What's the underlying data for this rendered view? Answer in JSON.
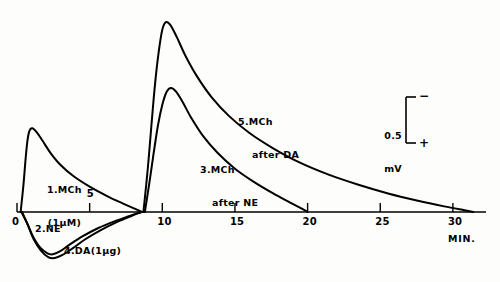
{
  "figure": {
    "title": "",
    "background_color": "#fdfdfb",
    "ink_color": "#000000"
  },
  "axis": {
    "x_name": "MIN.",
    "x_ticks": [
      "0",
      "5",
      "10",
      "15",
      "20",
      "25",
      "30"
    ],
    "x_tick_values": [
      0,
      5,
      10,
      15,
      20,
      25,
      30
    ]
  },
  "scale_bar": {
    "value": "0.5",
    "unit": "mV",
    "top_sign": "−",
    "bottom_sign": "+"
  },
  "curve_labels": {
    "c1_line1": "1.MCh",
    "c1_line2": "(1μM)",
    "c2": "2.NE",
    "c3_line1": "3.MCh",
    "c3_line2": "after NE",
    "c4": "4.DA(1μg)",
    "c5_line1": "5.MCh",
    "c5_line2": "after DA"
  },
  "chart_data": {
    "type": "line",
    "title": "",
    "xlabel": "MIN.",
    "ylabel": "mV",
    "xlim": [
      0,
      32
    ],
    "ylim": [
      -0.55,
      2.2
    ],
    "grid": false,
    "legend": "inline-annotations",
    "xticks": [
      0,
      5,
      10,
      15,
      20,
      25,
      30
    ],
    "scale_bar_mV": 0.5,
    "polarity": {
      "up": "negative",
      "down": "positive"
    },
    "series": [
      {
        "name": "1.MCh (1μM)",
        "label": "1.MCh (1μM)",
        "drug": "MCh",
        "dose": "1 μM",
        "peak_time_min": 0.85,
        "peak_mV": 0.86,
        "onset_time_min": 0.25,
        "return_time_min": 8.6,
        "points": [
          [
            0.25,
            0.0
          ],
          [
            0.45,
            0.3
          ],
          [
            0.6,
            0.58
          ],
          [
            0.72,
            0.76
          ],
          [
            0.85,
            0.86
          ],
          [
            1.05,
            0.89
          ],
          [
            1.35,
            0.85
          ],
          [
            1.75,
            0.76
          ],
          [
            2.3,
            0.63
          ],
          [
            3.0,
            0.5
          ],
          [
            3.9,
            0.38
          ],
          [
            5.0,
            0.27
          ],
          [
            6.2,
            0.17
          ],
          [
            7.3,
            0.09
          ],
          [
            8.1,
            0.035
          ],
          [
            8.6,
            0.0
          ]
        ]
      },
      {
        "name": "2.NE",
        "label": "2.NE",
        "drug": "NE",
        "dose": "",
        "trough_time_min": 2.3,
        "trough_mV": -0.45,
        "onset_time_min": 0.3,
        "return_time_min": 8.6,
        "points": [
          [
            0.3,
            0.0
          ],
          [
            0.7,
            -0.12
          ],
          [
            1.1,
            -0.26
          ],
          [
            1.6,
            -0.38
          ],
          [
            2.1,
            -0.44
          ],
          [
            2.45,
            -0.45
          ],
          [
            2.95,
            -0.42
          ],
          [
            3.6,
            -0.35
          ],
          [
            4.5,
            -0.26
          ],
          [
            5.6,
            -0.17
          ],
          [
            6.7,
            -0.1
          ],
          [
            7.7,
            -0.045
          ],
          [
            8.3,
            -0.012
          ],
          [
            8.6,
            0.0
          ]
        ]
      },
      {
        "name": "3.MCh after NE",
        "label": "3.MCh after NE",
        "drug": "MCh after NE",
        "dose": "",
        "peak_time_min": 10.5,
        "peak_mV": 1.32,
        "onset_time_min": 8.8,
        "return_time_min": 20.0,
        "points": [
          [
            8.8,
            0.0
          ],
          [
            9.1,
            0.3
          ],
          [
            9.4,
            0.62
          ],
          [
            9.7,
            0.92
          ],
          [
            10.0,
            1.14
          ],
          [
            10.3,
            1.28
          ],
          [
            10.6,
            1.32
          ],
          [
            10.95,
            1.28
          ],
          [
            11.4,
            1.17
          ],
          [
            12.0,
            1.0
          ],
          [
            12.8,
            0.81
          ],
          [
            13.8,
            0.63
          ],
          [
            15.0,
            0.46
          ],
          [
            16.3,
            0.32
          ],
          [
            17.6,
            0.2
          ],
          [
            18.8,
            0.1
          ],
          [
            19.6,
            0.035
          ],
          [
            20.0,
            0.0
          ]
        ]
      },
      {
        "name": "4.DA (1μg)",
        "label": "4.DA(1μg)",
        "drug": "DA",
        "dose": "1 μg",
        "trough_time_min": 2.6,
        "trough_mV": -0.49,
        "onset_time_min": 0.35,
        "return_time_min": 8.6,
        "points": [
          [
            0.35,
            0.0
          ],
          [
            0.75,
            -0.14
          ],
          [
            1.15,
            -0.29
          ],
          [
            1.65,
            -0.41
          ],
          [
            2.15,
            -0.48
          ],
          [
            2.6,
            -0.49
          ],
          [
            3.1,
            -0.46
          ],
          [
            3.8,
            -0.39
          ],
          [
            4.7,
            -0.29
          ],
          [
            5.8,
            -0.19
          ],
          [
            6.9,
            -0.105
          ],
          [
            7.9,
            -0.04
          ],
          [
            8.4,
            -0.01
          ],
          [
            8.6,
            0.0
          ]
        ]
      },
      {
        "name": "5.MCh after DA",
        "label": "5.MCh after DA",
        "drug": "MCh after DA",
        "dose": "",
        "peak_time_min": 10.2,
        "peak_mV": 2.02,
        "onset_time_min": 8.7,
        "return_time_min": 31.4,
        "points": [
          [
            8.7,
            0.0
          ],
          [
            9.0,
            0.46
          ],
          [
            9.25,
            0.92
          ],
          [
            9.5,
            1.36
          ],
          [
            9.75,
            1.7
          ],
          [
            10.0,
            1.94
          ],
          [
            10.25,
            2.02
          ],
          [
            10.55,
            1.99
          ],
          [
            11.0,
            1.86
          ],
          [
            11.6,
            1.66
          ],
          [
            12.4,
            1.44
          ],
          [
            13.4,
            1.22
          ],
          [
            14.6,
            1.02
          ],
          [
            16.0,
            0.84
          ],
          [
            17.6,
            0.68
          ],
          [
            19.4,
            0.53
          ],
          [
            21.4,
            0.4
          ],
          [
            23.5,
            0.29
          ],
          [
            25.6,
            0.195
          ],
          [
            27.6,
            0.12
          ],
          [
            29.4,
            0.06
          ],
          [
            30.8,
            0.018
          ],
          [
            31.4,
            0.0
          ]
        ]
      }
    ]
  }
}
